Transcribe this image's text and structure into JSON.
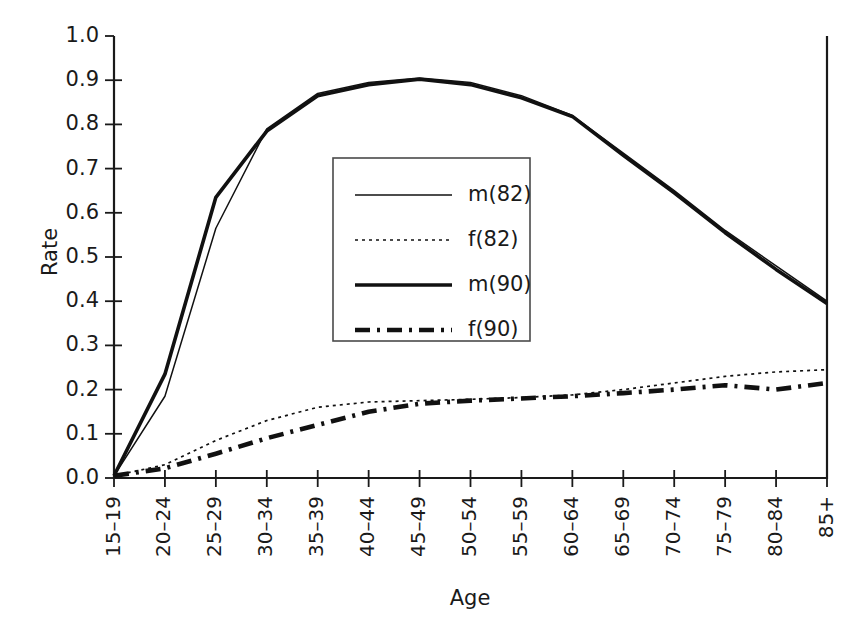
{
  "chart_data": {
    "type": "line",
    "title": "",
    "xlabel": "Age",
    "ylabel": "Rate",
    "categories": [
      "15–19",
      "20–24",
      "25–29",
      "30–34",
      "35–39",
      "40–44",
      "45–49",
      "50–54",
      "55–59",
      "60–64",
      "65–69",
      "70–74",
      "75–79",
      "80–84",
      "85+"
    ],
    "ylim": [
      0.0,
      1.0
    ],
    "ytick_labels": [
      "0.0",
      "0.1",
      "0.2",
      "0.3",
      "0.4",
      "0.5",
      "0.6",
      "0.7",
      "0.8",
      "0.9",
      "1.0"
    ],
    "ytick_values": [
      0.0,
      0.1,
      0.2,
      0.3,
      0.4,
      0.5,
      0.6,
      0.7,
      0.8,
      0.9,
      1.0
    ],
    "grid": false,
    "legend_position": "center-left-inside",
    "series": [
      {
        "name": "m(82)",
        "style": "thin-solid",
        "values": [
          0.005,
          0.185,
          0.565,
          0.79,
          0.87,
          0.895,
          0.905,
          0.895,
          0.865,
          0.82,
          0.735,
          0.65,
          0.56,
          0.48,
          0.4
        ]
      },
      {
        "name": "f(82)",
        "style": "dotted",
        "values": [
          0.005,
          0.03,
          0.085,
          0.13,
          0.16,
          0.172,
          0.175,
          0.178,
          0.182,
          0.188,
          0.2,
          0.215,
          0.23,
          0.24,
          0.245
        ]
      },
      {
        "name": "m(90)",
        "style": "thick-solid",
        "values": [
          0.005,
          0.235,
          0.635,
          0.785,
          0.865,
          0.89,
          0.902,
          0.89,
          0.86,
          0.818,
          0.73,
          0.645,
          0.555,
          0.472,
          0.395
        ]
      },
      {
        "name": "f(90)",
        "style": "thick-dash-dot",
        "values": [
          0.005,
          0.022,
          0.055,
          0.09,
          0.12,
          0.15,
          0.168,
          0.175,
          0.18,
          0.185,
          0.192,
          0.2,
          0.21,
          0.2,
          0.215
        ]
      }
    ]
  },
  "legend": {
    "items": [
      {
        "label": "m(82)"
      },
      {
        "label": "f(82)"
      },
      {
        "label": "m(90)"
      },
      {
        "label": "f(90)"
      }
    ]
  }
}
